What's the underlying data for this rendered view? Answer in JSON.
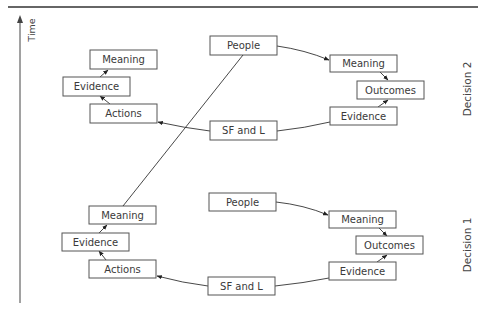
{
  "axis": {
    "label": "Time"
  },
  "sections": [
    {
      "label": "Decision 2",
      "nodes": {
        "meaning_left": "Meaning",
        "evidence_left": "Evidence",
        "actions": "Actions",
        "people": "People",
        "sf_and_l": "SF and L",
        "meaning_right": "Meaning",
        "outcomes": "Outcomes",
        "evidence_right": "Evidence"
      }
    },
    {
      "label": "Decision 1",
      "nodes": {
        "meaning_left": "Meaning",
        "evidence_left": "Evidence",
        "actions": "Actions",
        "people": "People",
        "sf_and_l": "SF and L",
        "meaning_right": "Meaning",
        "outcomes": "Outcomes",
        "evidence_right": "Evidence"
      }
    }
  ],
  "edges": [
    {
      "from": "People",
      "to": "Meaning (right)"
    },
    {
      "from": "Meaning (right)",
      "to": "Outcomes"
    },
    {
      "from": "Evidence (right)",
      "to": "Outcomes"
    },
    {
      "from": "Evidence (right)",
      "to": "SF and L"
    },
    {
      "from": "SF and L",
      "to": "Actions"
    },
    {
      "from": "Actions",
      "to": "Evidence (left)"
    },
    {
      "from": "Evidence (left)",
      "to": "Meaning (left)"
    },
    {
      "from": "Meaning (left) of Decision 1",
      "to": "People of Decision 2"
    }
  ]
}
